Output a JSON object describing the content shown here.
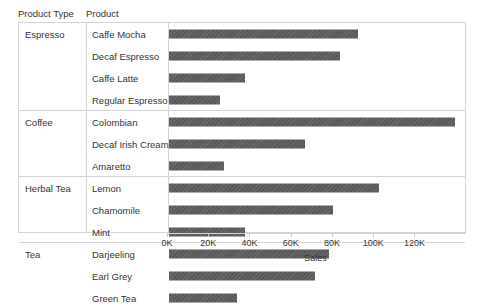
{
  "header": {
    "product_type_label": "Product Type",
    "product_label": "Product"
  },
  "axis": {
    "title": "Sales",
    "ticks": [
      "0K",
      "20K",
      "40K",
      "60K",
      "80K",
      "100K",
      "120K"
    ],
    "tick_values": [
      0,
      20000,
      40000,
      60000,
      80000,
      100000,
      120000
    ],
    "min": 0,
    "max": 145000
  },
  "colors": {
    "bar": "#595959",
    "grid": "#d4d4d4",
    "text": "#333333",
    "background": "#ffffff"
  },
  "groups": [
    {
      "type": "Espresso",
      "rows": [
        {
          "product": "Caffe Mocha",
          "sales": 92000
        },
        {
          "product": "Decaf Espresso",
          "sales": 83000
        },
        {
          "product": "Caffe Latte",
          "sales": 37000
        },
        {
          "product": "Regular Espresso",
          "sales": 25000
        }
      ]
    },
    {
      "type": "Coffee",
      "rows": [
        {
          "product": "Colombian",
          "sales": 139000
        },
        {
          "product": "Decaf Irish Cream",
          "sales": 66000
        },
        {
          "product": "Amaretto",
          "sales": 27000
        }
      ]
    },
    {
      "type": "Herbal Tea",
      "rows": [
        {
          "product": "Lemon",
          "sales": 102000
        },
        {
          "product": "Chamomile",
          "sales": 80000
        },
        {
          "product": "Mint",
          "sales": 37000
        }
      ]
    },
    {
      "type": "Tea",
      "rows": [
        {
          "product": "Darjeeling",
          "sales": 78000
        },
        {
          "product": "Earl Grey",
          "sales": 71000
        },
        {
          "product": "Green Tea",
          "sales": 33000
        }
      ]
    }
  ],
  "chart_data": {
    "type": "bar",
    "orientation": "horizontal",
    "title": "",
    "xlabel": "Sales",
    "ylabel": "",
    "grid": false,
    "legend": "none",
    "xlim": [
      0,
      145000
    ],
    "xticks": [
      0,
      20000,
      40000,
      60000,
      80000,
      100000,
      120000
    ],
    "xticklabels": [
      "0K",
      "20K",
      "40K",
      "60K",
      "80K",
      "100K",
      "120K"
    ],
    "group_field": "Product Type",
    "category_field": "Product",
    "categories": [
      "Caffe Mocha",
      "Decaf Espresso",
      "Caffe Latte",
      "Regular Espresso",
      "Colombian",
      "Decaf Irish Cream",
      "Amaretto",
      "Lemon",
      "Chamomile",
      "Mint",
      "Darjeeling",
      "Earl Grey",
      "Green Tea"
    ],
    "groups": [
      "Espresso",
      "Espresso",
      "Espresso",
      "Espresso",
      "Coffee",
      "Coffee",
      "Coffee",
      "Herbal Tea",
      "Herbal Tea",
      "Herbal Tea",
      "Tea",
      "Tea",
      "Tea"
    ],
    "values": [
      92000,
      83000,
      37000,
      25000,
      139000,
      66000,
      27000,
      102000,
      80000,
      37000,
      78000,
      71000,
      33000
    ]
  }
}
